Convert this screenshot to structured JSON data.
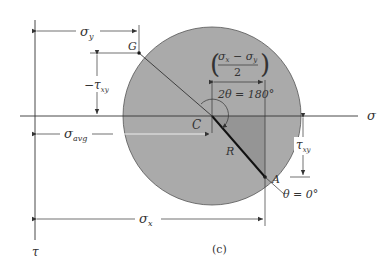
{
  "figure": {
    "caption": "(c)",
    "axes": {
      "horizontal": "σ",
      "vertical": "τ"
    },
    "points": {
      "center": "C",
      "G": "G",
      "A": "A",
      "radius": "R"
    },
    "dimensions": {
      "sigma_y": {
        "main": "σ",
        "sub": "y"
      },
      "neg_tau_xy": {
        "prefix": "−",
        "main": "τ",
        "sub": "xy"
      },
      "sigma_avg": {
        "main": "σ",
        "sub": "avg"
      },
      "sigma_x": {
        "main": "σ",
        "sub": "x"
      },
      "tau_xy": {
        "main": "τ",
        "sub": "xy"
      },
      "half_diff": {
        "num_a": "σ",
        "sub_a": "x",
        "minus": " − ",
        "num_b": "σ",
        "sub_b": "y",
        "den": "2"
      }
    },
    "angles": {
      "two_theta": "2θ = 180°",
      "theta_zero": "θ = 0°"
    },
    "colors": {
      "circle_fill": "#aaaaaa",
      "triangle_fill": "#959595",
      "line": "#333333"
    }
  }
}
